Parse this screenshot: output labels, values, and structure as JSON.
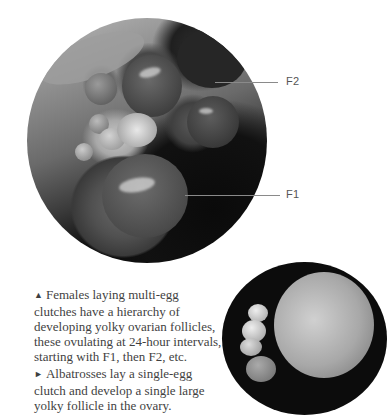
{
  "figure": {
    "main_photo": {
      "description": "Dissected ovary showing hierarchy of yolky follicles",
      "labels": [
        {
          "id": "F2",
          "text": "F2"
        },
        {
          "id": "F1",
          "text": "F1"
        }
      ]
    },
    "small_photo": {
      "description": "Albatross ovary with single large yolky follicle"
    }
  },
  "captions": [
    {
      "marker": "▲",
      "marker_icon": "triangle-up-icon",
      "text": "Females laying multi-egg clutches have a hierarchy of developing yolky ovarian follicles, these ovulating at 24-hour intervals, starting with F1, then F2, etc."
    },
    {
      "marker": "►",
      "marker_icon": "triangle-right-icon",
      "text": "Albatrosses lay a single-egg clutch and develop a single large yolky follicle in the ovary."
    }
  ]
}
